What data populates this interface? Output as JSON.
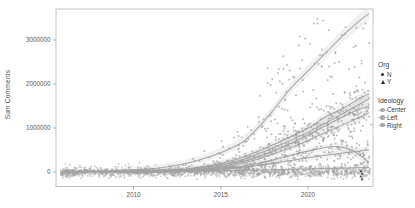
{
  "chart_data": {
    "type": "scatter",
    "title": "",
    "xlabel": "",
    "ylabel": "Sum Comments",
    "x_ticks": [
      2010,
      2015,
      2020
    ],
    "y_ticks": [
      0,
      1000000,
      2000000,
      3000000
    ],
    "x_range": [
      2005.6,
      2023.7
    ],
    "y_range": [
      -330000,
      3700000
    ],
    "grid": false,
    "legend": {
      "position": "right",
      "org": {
        "title": "Org",
        "items": [
          {
            "label": "N",
            "shape": "circle"
          },
          {
            "label": "Y",
            "shape": "triangle"
          }
        ]
      },
      "ideology": {
        "title": "Ideology",
        "items": [
          {
            "label": "Center"
          },
          {
            "label": "Left"
          },
          {
            "label": "Right"
          }
        ]
      }
    },
    "smooth_series": [
      {
        "name": "steep",
        "points": [
          [
            2005.9,
            5000
          ],
          [
            2008,
            20000
          ],
          [
            2010,
            50000
          ],
          [
            2012,
            120000
          ],
          [
            2014,
            300000
          ],
          [
            2016,
            620000
          ],
          [
            2017,
            950000
          ],
          [
            2018,
            1400000
          ],
          [
            2019,
            1900000
          ],
          [
            2020,
            2300000
          ],
          [
            2021,
            2700000
          ],
          [
            2022,
            3100000
          ],
          [
            2023,
            3450000
          ],
          [
            2023.5,
            3600000
          ]
        ],
        "ribbon": [
          30000,
          140000
        ]
      },
      {
        "name": "upper-a",
        "points": [
          [
            2008,
            5000
          ],
          [
            2012,
            40000
          ],
          [
            2014,
            120000
          ],
          [
            2016,
            300000
          ],
          [
            2018,
            620000
          ],
          [
            2020,
            1000000
          ],
          [
            2021,
            1250000
          ],
          [
            2022,
            1450000
          ],
          [
            2023,
            1680000
          ],
          [
            2023.5,
            1780000
          ]
        ],
        "ribbon": [
          20000,
          90000
        ]
      },
      {
        "name": "upper-b",
        "points": [
          [
            2008,
            4000
          ],
          [
            2012,
            30000
          ],
          [
            2014,
            100000
          ],
          [
            2016,
            250000
          ],
          [
            2018,
            550000
          ],
          [
            2020,
            900000
          ],
          [
            2022,
            1330000
          ],
          [
            2023,
            1550000
          ],
          [
            2023.5,
            1660000
          ]
        ],
        "ribbon": [
          20000,
          90000
        ]
      },
      {
        "name": "upper-c",
        "points": [
          [
            2010,
            5000
          ],
          [
            2013,
            40000
          ],
          [
            2015,
            120000
          ],
          [
            2017,
            330000
          ],
          [
            2019,
            650000
          ],
          [
            2021,
            1050000
          ],
          [
            2022.5,
            1350000
          ],
          [
            2023.5,
            1500000
          ]
        ],
        "ribbon": [
          18000,
          80000
        ]
      },
      {
        "name": "upper-d",
        "points": [
          [
            2010,
            4000
          ],
          [
            2013,
            30000
          ],
          [
            2015,
            100000
          ],
          [
            2017,
            280000
          ],
          [
            2019,
            550000
          ],
          [
            2021,
            900000
          ],
          [
            2023,
            1250000
          ],
          [
            2023.5,
            1350000
          ]
        ],
        "ribbon": [
          18000,
          80000
        ]
      },
      {
        "name": "lower-dip",
        "points": [
          [
            2010,
            3000
          ],
          [
            2013,
            20000
          ],
          [
            2015,
            70000
          ],
          [
            2017,
            180000
          ],
          [
            2019,
            380000
          ],
          [
            2020.5,
            520000
          ],
          [
            2021.5,
            580000
          ],
          [
            2022.5,
            500000
          ],
          [
            2023.5,
            220000
          ]
        ],
        "ribbon": [
          15000,
          70000
        ]
      },
      {
        "name": "lower-flat",
        "points": [
          [
            2008,
            2000
          ],
          [
            2012,
            20000
          ],
          [
            2015,
            60000
          ],
          [
            2017,
            140000
          ],
          [
            2019,
            260000
          ],
          [
            2021,
            380000
          ],
          [
            2023,
            480000
          ],
          [
            2023.5,
            500000
          ]
        ],
        "ribbon": [
          15000,
          60000
        ]
      },
      {
        "name": "near-zero",
        "points": [
          [
            2006,
            1000
          ],
          [
            2010,
            5000
          ],
          [
            2014,
            20000
          ],
          [
            2018,
            50000
          ],
          [
            2021,
            80000
          ],
          [
            2023.5,
            100000
          ]
        ],
        "ribbon": [
          12000,
          40000
        ]
      }
    ],
    "scatter_style": {
      "point_color": "#a3a3a3",
      "line_color": "#a2a2a2",
      "ribbon_opacity": 0.055
    },
    "scatter_points": {
      "seed": 20231,
      "baseline_band": {
        "count": 1150,
        "year_min": 2005.8,
        "year_max": 2023.6,
        "center_value": -15000,
        "sd_value": 55000,
        "lift_chance": 0.12,
        "lift_max": 170000
      },
      "start_blob": {
        "year": 2006.3,
        "value": 0,
        "extra_points": 70
      },
      "clusters": [
        {
          "series": "steep",
          "count": 150,
          "t0": 2012,
          "pow": 0.5,
          "rel": 0.32,
          "abs": 90000
        },
        {
          "series": "upper-a",
          "count": 100,
          "t0": 2012,
          "pow": 0.6,
          "rel": 0.22,
          "abs": 50000
        },
        {
          "series": "upper-b",
          "count": 100,
          "t0": 2012,
          "pow": 0.6,
          "rel": 0.22,
          "abs": 50000
        },
        {
          "series": "upper-c",
          "count": 90,
          "t0": 2013,
          "pow": 0.6,
          "rel": 0.22,
          "abs": 45000
        },
        {
          "series": "upper-d",
          "count": 90,
          "t0": 2013,
          "pow": 0.6,
          "rel": 0.22,
          "abs": 45000
        },
        {
          "series": "lower-dip",
          "count": 110,
          "t0": 2012,
          "pow": 0.65,
          "rel": 0.3,
          "abs": 40000
        },
        {
          "series": "lower-flat",
          "count": 110,
          "t0": 2010,
          "pow": 0.65,
          "rel": 0.3,
          "abs": 40000
        },
        {
          "series": "near-zero",
          "count": 140,
          "t0": 2006,
          "pow": 0.8,
          "rel": 0.5,
          "abs": 25000
        }
      ],
      "dark_triangle_cluster": {
        "year": 2023.05,
        "value": 0,
        "count": 4,
        "color": "#444444"
      }
    }
  }
}
